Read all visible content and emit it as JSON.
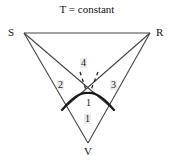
{
  "figure": {
    "title": "T = constant",
    "type": "ternary-phase-diagram",
    "background": "#ffffff",
    "line_color": "#333333",
    "bold_curve_color": "#1a1a1a",
    "label_color": "#111111",
    "region_label_bg": "#e4e4e4"
  },
  "vertices": {
    "s": {
      "label": "S",
      "x": 24,
      "y": 33
    },
    "r": {
      "label": "R",
      "x": 150,
      "y": 33
    },
    "v": {
      "label": "V",
      "x": 88,
      "y": 143
    }
  },
  "regions": [
    {
      "id": "region-4",
      "label": "4",
      "x": 84,
      "y": 63
    },
    {
      "id": "region-2",
      "label": "2",
      "x": 61,
      "y": 85
    },
    {
      "id": "region-3",
      "label": "3",
      "x": 114,
      "y": 85
    },
    {
      "id": "region-1a",
      "label": "1",
      "x": 88,
      "y": 103
    },
    {
      "id": "region-1b",
      "label": "1",
      "x": 88,
      "y": 119
    }
  ],
  "geometry": {
    "crossing_point": {
      "x": 88,
      "y": 93
    },
    "edge_sr": "M24,33 L150,33",
    "edge_sv": "M24,33 L88,143",
    "edge_rv": "M150,33 L88,143",
    "line_s_to_right": "M24,33 L114,110",
    "line_r_to_left": "M150,33 L62,110",
    "bold_curve": "M62,110 C72,98 80,92 88,93 C96,92 104,98 114,110",
    "tie_line_left": "M80,72 L86,90",
    "tie_line_right": "M98,72 L91,90"
  },
  "chart_data": {
    "type": "scatter",
    "title": "T = constant",
    "xlabel": "",
    "ylabel": "",
    "annotations": [
      "S",
      "R",
      "V",
      "1",
      "2",
      "3",
      "4"
    ]
  }
}
